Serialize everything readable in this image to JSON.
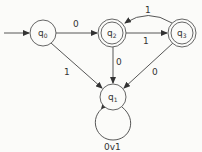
{
  "diagram": {
    "type": "finite-automaton",
    "states": [
      {
        "id": "q0",
        "name": "q",
        "sub": "0",
        "initial": true,
        "accepting": false
      },
      {
        "id": "q1",
        "name": "q",
        "sub": "1",
        "initial": false,
        "accepting": false
      },
      {
        "id": "q2",
        "name": "q",
        "sub": "2",
        "initial": false,
        "accepting": true
      },
      {
        "id": "q3",
        "name": "q",
        "sub": "3",
        "initial": false,
        "accepting": true
      }
    ],
    "transitions": [
      {
        "from": "q0",
        "to": "q2",
        "label": "0"
      },
      {
        "from": "q0",
        "to": "q1",
        "label": "1"
      },
      {
        "from": "q2",
        "to": "q3",
        "label": "1"
      },
      {
        "from": "q3",
        "to": "q2",
        "label": "1"
      },
      {
        "from": "q2",
        "to": "q1",
        "label": "0"
      },
      {
        "from": "q3",
        "to": "q1",
        "label": "0"
      },
      {
        "from": "q1",
        "to": "q1",
        "label": "0v1"
      }
    ]
  }
}
